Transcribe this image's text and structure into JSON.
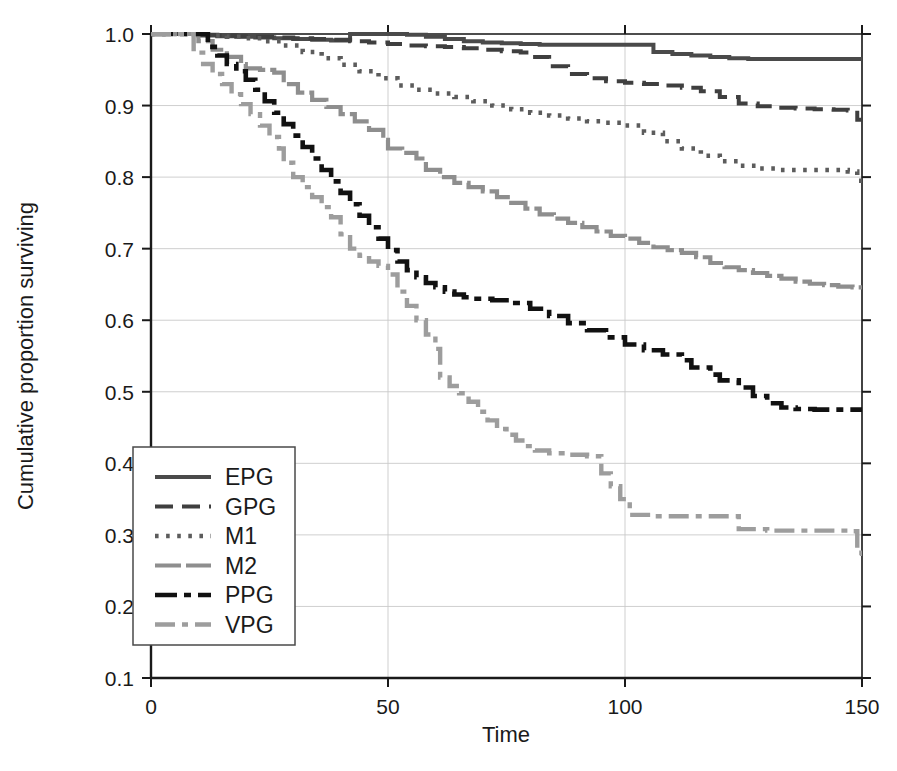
{
  "chart_data": {
    "type": "line",
    "subtype": "kaplan-meier-step",
    "title": "",
    "xlabel": "Time",
    "ylabel": "Cumulative proportion surviving",
    "xlim": [
      0,
      150
    ],
    "ylim": [
      0.1,
      1.0
    ],
    "xticks": [
      0,
      50,
      100,
      150
    ],
    "xtick_labels": [
      "0",
      "50",
      "100",
      "150"
    ],
    "yticks": [
      0.1,
      0.2,
      0.3,
      0.4,
      0.5,
      0.6,
      0.7,
      0.8,
      0.9,
      1.0
    ],
    "ytick_labels": [
      "0.1",
      "0.2",
      "0.3",
      "0.4",
      "0.5",
      "0.6",
      "0.7",
      "0.8",
      "0.9",
      "1.0"
    ],
    "grid": true,
    "grid_color": "#c9c9c9",
    "legend_position": "lower-left",
    "legend_entries": [
      "EPG",
      "GPG",
      "M1",
      "M2",
      "PPG",
      "VPG"
    ],
    "series": [
      {
        "name": "EPG",
        "color": "#4a4a4a",
        "dash": "none",
        "width": 4.0,
        "final_value": 0.965,
        "points": [
          [
            0,
            1.0
          ],
          [
            8,
            1.0
          ],
          [
            10,
            0.998
          ],
          [
            14,
            0.997
          ],
          [
            18,
            0.996
          ],
          [
            22,
            0.995
          ],
          [
            26,
            0.994
          ],
          [
            30,
            0.993
          ],
          [
            34,
            0.992
          ],
          [
            38,
            0.991
          ],
          [
            42,
            1.0
          ],
          [
            46,
            1.0
          ],
          [
            50,
            1.0
          ],
          [
            54,
            0.999
          ],
          [
            58,
            0.996
          ],
          [
            62,
            0.993
          ],
          [
            66,
            0.99
          ],
          [
            70,
            0.988
          ],
          [
            74,
            0.987
          ],
          [
            78,
            0.986
          ],
          [
            82,
            0.985
          ],
          [
            86,
            0.985
          ],
          [
            90,
            0.985
          ],
          [
            94,
            0.985
          ],
          [
            98,
            0.985
          ],
          [
            102,
            0.985
          ],
          [
            106,
            0.975
          ],
          [
            110,
            0.972
          ],
          [
            114,
            0.97
          ],
          [
            118,
            0.968
          ],
          [
            122,
            0.966
          ],
          [
            126,
            0.965
          ],
          [
            134,
            0.965
          ],
          [
            142,
            0.965
          ],
          [
            150,
            0.965
          ]
        ]
      },
      {
        "name": "GPG",
        "color": "#3f3f3f",
        "dash": "dashed",
        "width": 4.0,
        "final_value": 0.878,
        "points": [
          [
            0,
            1.0
          ],
          [
            6,
            1.0
          ],
          [
            10,
            0.999
          ],
          [
            14,
            0.998
          ],
          [
            18,
            0.997
          ],
          [
            22,
            0.996
          ],
          [
            26,
            0.995
          ],
          [
            30,
            0.994
          ],
          [
            34,
            0.993
          ],
          [
            38,
            0.992
          ],
          [
            42,
            0.99
          ],
          [
            46,
            0.988
          ],
          [
            50,
            0.986
          ],
          [
            54,
            0.984
          ],
          [
            58,
            0.983
          ],
          [
            62,
            0.982
          ],
          [
            66,
            0.98
          ],
          [
            70,
            0.978
          ],
          [
            74,
            0.976
          ],
          [
            78,
            0.974
          ],
          [
            80,
            0.968
          ],
          [
            84,
            0.955
          ],
          [
            88,
            0.944
          ],
          [
            92,
            0.938
          ],
          [
            96,
            0.934
          ],
          [
            100,
            0.932
          ],
          [
            104,
            0.93
          ],
          [
            108,
            0.928
          ],
          [
            112,
            0.925
          ],
          [
            116,
            0.92
          ],
          [
            120,
            0.912
          ],
          [
            124,
            0.903
          ],
          [
            128,
            0.899
          ],
          [
            132,
            0.897
          ],
          [
            136,
            0.896
          ],
          [
            140,
            0.895
          ],
          [
            144,
            0.894
          ],
          [
            147,
            0.893
          ],
          [
            149,
            0.88
          ],
          [
            150,
            0.878
          ]
        ]
      },
      {
        "name": "M1",
        "color": "#5c5c5c",
        "dash": "dotted",
        "width": 4.5,
        "final_value": 0.792,
        "points": [
          [
            0,
            1.0
          ],
          [
            8,
            1.0
          ],
          [
            12,
            0.998
          ],
          [
            16,
            0.996
          ],
          [
            20,
            0.994
          ],
          [
            24,
            0.99
          ],
          [
            28,
            0.984
          ],
          [
            32,
            0.975
          ],
          [
            36,
            0.966
          ],
          [
            40,
            0.957
          ],
          [
            44,
            0.948
          ],
          [
            48,
            0.938
          ],
          [
            52,
            0.928
          ],
          [
            56,
            0.922
          ],
          [
            60,
            0.917
          ],
          [
            64,
            0.912
          ],
          [
            68,
            0.906
          ],
          [
            72,
            0.9
          ],
          [
            76,
            0.895
          ],
          [
            80,
            0.89
          ],
          [
            84,
            0.886
          ],
          [
            88,
            0.882
          ],
          [
            92,
            0.878
          ],
          [
            96,
            0.876
          ],
          [
            100,
            0.872
          ],
          [
            104,
            0.862
          ],
          [
            108,
            0.85
          ],
          [
            112,
            0.84
          ],
          [
            116,
            0.83
          ],
          [
            120,
            0.822
          ],
          [
            124,
            0.816
          ],
          [
            128,
            0.812
          ],
          [
            132,
            0.81
          ],
          [
            136,
            0.81
          ],
          [
            140,
            0.81
          ],
          [
            144,
            0.81
          ],
          [
            147,
            0.808
          ],
          [
            149,
            0.795
          ],
          [
            150,
            0.792
          ]
        ]
      },
      {
        "name": "M2",
        "color": "#8e8e8e",
        "dash": "longdash",
        "width": 4.2,
        "final_value": 0.645,
        "points": [
          [
            0,
            1.0
          ],
          [
            8,
            1.0
          ],
          [
            10,
            0.99
          ],
          [
            13,
            0.978
          ],
          [
            16,
            0.968
          ],
          [
            19,
            0.958
          ],
          [
            20,
            0.952
          ],
          [
            23,
            0.95
          ],
          [
            26,
            0.946
          ],
          [
            28,
            0.93
          ],
          [
            31,
            0.918
          ],
          [
            34,
            0.908
          ],
          [
            37,
            0.898
          ],
          [
            40,
            0.888
          ],
          [
            43,
            0.878
          ],
          [
            46,
            0.866
          ],
          [
            49,
            0.852
          ],
          [
            50,
            0.84
          ],
          [
            53,
            0.834
          ],
          [
            56,
            0.826
          ],
          [
            58,
            0.81
          ],
          [
            61,
            0.8
          ],
          [
            64,
            0.792
          ],
          [
            67,
            0.786
          ],
          [
            70,
            0.78
          ],
          [
            73,
            0.772
          ],
          [
            76,
            0.764
          ],
          [
            79,
            0.756
          ],
          [
            82,
            0.748
          ],
          [
            85,
            0.742
          ],
          [
            88,
            0.736
          ],
          [
            91,
            0.73
          ],
          [
            94,
            0.724
          ],
          [
            97,
            0.718
          ],
          [
            100,
            0.714
          ],
          [
            103,
            0.708
          ],
          [
            106,
            0.702
          ],
          [
            109,
            0.698
          ],
          [
            112,
            0.694
          ],
          [
            115,
            0.688
          ],
          [
            118,
            0.68
          ],
          [
            121,
            0.674
          ],
          [
            124,
            0.67
          ],
          [
            127,
            0.666
          ],
          [
            130,
            0.662
          ],
          [
            133,
            0.658
          ],
          [
            136,
            0.654
          ],
          [
            139,
            0.651
          ],
          [
            142,
            0.649
          ],
          [
            145,
            0.647
          ],
          [
            148,
            0.646
          ],
          [
            150,
            0.645
          ]
        ]
      },
      {
        "name": "PPG",
        "color": "#111111",
        "dash": "dashdot",
        "width": 4.6,
        "final_value": 0.475,
        "points": [
          [
            0,
            1.0
          ],
          [
            10,
            1.0
          ],
          [
            12,
            0.982
          ],
          [
            14,
            0.97
          ],
          [
            16,
            0.958
          ],
          [
            18,
            0.948
          ],
          [
            20,
            0.936
          ],
          [
            22,
            0.922
          ],
          [
            24,
            0.906
          ],
          [
            26,
            0.89
          ],
          [
            28,
            0.874
          ],
          [
            30,
            0.858
          ],
          [
            32,
            0.842
          ],
          [
            34,
            0.826
          ],
          [
            36,
            0.81
          ],
          [
            38,
            0.794
          ],
          [
            40,
            0.778
          ],
          [
            42,
            0.762
          ],
          [
            44,
            0.746
          ],
          [
            46,
            0.73
          ],
          [
            48,
            0.714
          ],
          [
            50,
            0.698
          ],
          [
            52,
            0.682
          ],
          [
            54,
            0.67
          ],
          [
            56,
            0.66
          ],
          [
            58,
            0.652
          ],
          [
            60,
            0.646
          ],
          [
            62,
            0.64
          ],
          [
            64,
            0.636
          ],
          [
            66,
            0.632
          ],
          [
            68,
            0.63
          ],
          [
            72,
            0.628
          ],
          [
            76,
            0.624
          ],
          [
            80,
            0.616
          ],
          [
            84,
            0.606
          ],
          [
            88,
            0.596
          ],
          [
            92,
            0.586
          ],
          [
            96,
            0.576
          ],
          [
            100,
            0.566
          ],
          [
            104,
            0.558
          ],
          [
            108,
            0.552
          ],
          [
            112,
            0.544
          ],
          [
            114,
            0.534
          ],
          [
            118,
            0.524
          ],
          [
            120,
            0.516
          ],
          [
            124,
            0.506
          ],
          [
            127,
            0.494
          ],
          [
            130,
            0.484
          ],
          [
            133,
            0.478
          ],
          [
            136,
            0.476
          ],
          [
            140,
            0.475
          ],
          [
            145,
            0.475
          ],
          [
            150,
            0.475
          ]
        ]
      },
      {
        "name": "VPG",
        "color": "#9d9d9d",
        "dash": "dashdot2",
        "width": 4.4,
        "final_value": 0.265,
        "points": [
          [
            0,
            1.0
          ],
          [
            7,
            1.0
          ],
          [
            9,
            0.974
          ],
          [
            11,
            0.958
          ],
          [
            13,
            0.944
          ],
          [
            15,
            0.93
          ],
          [
            17,
            0.916
          ],
          [
            19,
            0.902
          ],
          [
            21,
            0.888
          ],
          [
            23,
            0.872
          ],
          [
            25,
            0.856
          ],
          [
            27,
            0.84
          ],
          [
            28,
            0.82
          ],
          [
            30,
            0.8
          ],
          [
            32,
            0.786
          ],
          [
            34,
            0.772
          ],
          [
            36,
            0.758
          ],
          [
            38,
            0.744
          ],
          [
            40,
            0.72
          ],
          [
            42,
            0.7
          ],
          [
            44,
            0.69
          ],
          [
            46,
            0.682
          ],
          [
            48,
            0.676
          ],
          [
            50,
            0.664
          ],
          [
            52,
            0.64
          ],
          [
            54,
            0.62
          ],
          [
            56,
            0.6
          ],
          [
            58,
            0.58
          ],
          [
            60,
            0.56
          ],
          [
            61,
            0.52
          ],
          [
            63,
            0.508
          ],
          [
            65,
            0.498
          ],
          [
            67,
            0.486
          ],
          [
            69,
            0.472
          ],
          [
            71,
            0.46
          ],
          [
            73,
            0.448
          ],
          [
            75,
            0.44
          ],
          [
            77,
            0.432
          ],
          [
            79,
            0.424
          ],
          [
            81,
            0.418
          ],
          [
            84,
            0.414
          ],
          [
            88,
            0.412
          ],
          [
            92,
            0.41
          ],
          [
            95,
            0.386
          ],
          [
            97,
            0.368
          ],
          [
            99,
            0.35
          ],
          [
            101,
            0.328
          ],
          [
            106,
            0.326
          ],
          [
            112,
            0.326
          ],
          [
            118,
            0.326
          ],
          [
            122,
            0.326
          ],
          [
            124,
            0.308
          ],
          [
            130,
            0.306
          ],
          [
            136,
            0.306
          ],
          [
            142,
            0.306
          ],
          [
            147,
            0.305
          ],
          [
            149,
            0.275
          ],
          [
            150,
            0.265
          ]
        ]
      }
    ]
  },
  "legend": {
    "items": [
      {
        "label": "EPG"
      },
      {
        "label": "GPG"
      },
      {
        "label": "M1"
      },
      {
        "label": "M2"
      },
      {
        "label": "PPG"
      },
      {
        "label": "VPG"
      }
    ]
  },
  "axes": {
    "x_title": "Time",
    "y_title": "Cumulative proportion surviving"
  }
}
